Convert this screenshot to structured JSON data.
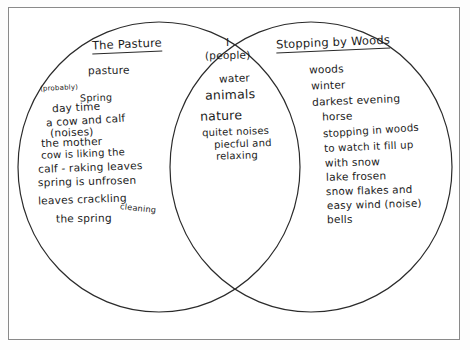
{
  "document": {
    "type": "venn-diagram-worksheet",
    "description": "Hand-drawn two-circle Venn diagram comparing two poems"
  },
  "left_circle": {
    "title": "The Pasture",
    "items": [
      "pasture",
      "(probably)",
      "Spring",
      "day time",
      "a cow and calf",
      "the mother",
      "cow is liking the",
      "calf - raking leaves",
      "spring is unfrosen",
      "leaves crackling",
      "the  spring",
      "cleaning",
      "(noises)"
    ]
  },
  "overlap": {
    "items": [
      "I",
      "(people)",
      "water",
      "animals",
      "nature",
      "quitet noises",
      "piecful and",
      "relaxing"
    ]
  },
  "right_circle": {
    "title": "Stopping by Woods",
    "items": [
      "woods",
      "winter",
      "darkest evening",
      "horse",
      "stopping in woods",
      "to watch it fill up",
      "with snow",
      "lake frosen",
      "snow flakes and",
      "easy wind (noise)",
      "bells"
    ]
  },
  "colors": {
    "ink": "#1b1b1b",
    "paper": "#ffffff",
    "frame": "#8a8a8a"
  }
}
